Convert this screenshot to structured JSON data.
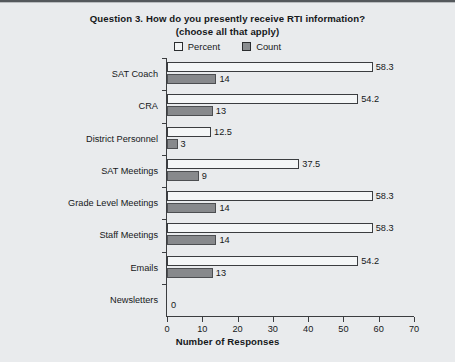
{
  "chart_data": {
    "type": "bar",
    "title_lines": [
      "Question 3. How do you presently receive RTI information?",
      "(choose all that apply)"
    ],
    "title": "Question 3. How do you presently receive RTI information? (choose all that apply)",
    "orientation": "horizontal",
    "categories": [
      "SAT Coach",
      "CRA",
      "District Personnel",
      "SAT Meetings",
      "Grade Level Meetings",
      "Staff Meetings",
      "Emails",
      "Newsletters"
    ],
    "series": [
      {
        "name": "Percent",
        "values": [
          58.3,
          54.2,
          12.5,
          37.5,
          58.3,
          58.3,
          54.2,
          0
        ],
        "labels": [
          "58.3",
          "54.2",
          "12.5",
          "37.5",
          "58.3",
          "58.3",
          "54.2",
          "0"
        ],
        "color": "#f4f6f7",
        "edge_color": "#3b3d40"
      },
      {
        "name": "Count",
        "values": [
          14,
          13,
          3,
          9,
          14,
          14,
          13,
          0
        ],
        "labels": [
          "14",
          "13",
          "3",
          "9",
          "14",
          "14",
          "13",
          ""
        ],
        "color": "#87898c",
        "edge_color": "#4c4e51"
      }
    ],
    "xlabel": "Number of Responses",
    "ylabel": "",
    "xlim": [
      0,
      70
    ],
    "xticks": [
      0,
      10,
      20,
      30,
      40,
      50,
      60,
      70
    ],
    "xtick_labels": [
      "0",
      "10",
      "20",
      "30",
      "40",
      "50",
      "60",
      "70"
    ],
    "grid": false,
    "legend_position": "top-center",
    "legend": [
      "Percent",
      "Count"
    ],
    "background_color": "#e9ebed"
  }
}
